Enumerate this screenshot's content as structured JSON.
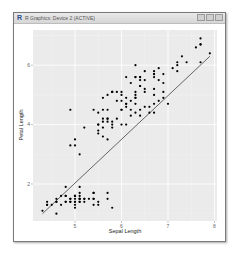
{
  "window": {
    "title": "R Graphics: Device 2 (ACTIVE)",
    "app_icon": "R",
    "controls": [
      "minimize",
      "maximize",
      "close"
    ]
  },
  "chart_data": {
    "type": "scatter",
    "title": "",
    "xlabel": "Sepal Length",
    "ylabel": "Petal Length",
    "xlim": [
      4.2,
      8.0
    ],
    "ylim": [
      0.9,
      7.0
    ],
    "x_ticks": [
      5,
      6,
      7,
      8
    ],
    "y_ticks": [
      2,
      4,
      6
    ],
    "grid": true,
    "background": "#ebebeb",
    "point_color": "#000000",
    "line_color": "#555555",
    "fit_line": {
      "x": [
        4.3,
        7.9
      ],
      "y": [
        1.0,
        6.3
      ]
    },
    "points": [
      [
        5.1,
        1.4
      ],
      [
        4.9,
        1.4
      ],
      [
        4.7,
        1.3
      ],
      [
        4.6,
        1.5
      ],
      [
        5.0,
        1.4
      ],
      [
        5.4,
        1.7
      ],
      [
        4.6,
        1.4
      ],
      [
        5.0,
        1.5
      ],
      [
        4.4,
        1.4
      ],
      [
        4.9,
        1.5
      ],
      [
        5.4,
        1.5
      ],
      [
        4.8,
        1.6
      ],
      [
        4.8,
        1.4
      ],
      [
        4.3,
        1.1
      ],
      [
        5.8,
        1.2
      ],
      [
        5.7,
        1.5
      ],
      [
        5.4,
        1.3
      ],
      [
        5.1,
        1.4
      ],
      [
        5.7,
        1.7
      ],
      [
        5.1,
        1.5
      ],
      [
        5.4,
        1.7
      ],
      [
        5.1,
        1.5
      ],
      [
        4.6,
        1.0
      ],
      [
        5.1,
        1.7
      ],
      [
        4.8,
        1.9
      ],
      [
        5.0,
        1.6
      ],
      [
        5.0,
        1.6
      ],
      [
        5.2,
        1.5
      ],
      [
        5.2,
        1.4
      ],
      [
        4.7,
        1.6
      ],
      [
        4.8,
        1.6
      ],
      [
        5.4,
        1.5
      ],
      [
        5.2,
        1.5
      ],
      [
        5.5,
        1.4
      ],
      [
        4.9,
        1.5
      ],
      [
        5.0,
        1.2
      ],
      [
        5.5,
        1.3
      ],
      [
        4.9,
        1.4
      ],
      [
        4.4,
        1.3
      ],
      [
        5.1,
        1.5
      ],
      [
        5.0,
        1.3
      ],
      [
        4.5,
        1.3
      ],
      [
        4.4,
        1.3
      ],
      [
        5.0,
        1.6
      ],
      [
        5.1,
        1.9
      ],
      [
        4.8,
        1.4
      ],
      [
        5.1,
        1.6
      ],
      [
        4.6,
        1.4
      ],
      [
        5.3,
        1.5
      ],
      [
        5.0,
        1.4
      ],
      [
        7.0,
        4.7
      ],
      [
        6.4,
        4.5
      ],
      [
        6.9,
        4.9
      ],
      [
        5.5,
        4.0
      ],
      [
        6.5,
        4.6
      ],
      [
        5.7,
        4.5
      ],
      [
        6.3,
        4.7
      ],
      [
        4.9,
        3.3
      ],
      [
        6.6,
        4.6
      ],
      [
        5.2,
        3.9
      ],
      [
        5.0,
        3.5
      ],
      [
        5.9,
        4.2
      ],
      [
        6.0,
        4.0
      ],
      [
        6.1,
        4.7
      ],
      [
        5.6,
        3.6
      ],
      [
        6.7,
        4.4
      ],
      [
        5.6,
        4.5
      ],
      [
        5.8,
        4.1
      ],
      [
        6.2,
        4.5
      ],
      [
        5.6,
        3.9
      ],
      [
        5.9,
        4.8
      ],
      [
        6.1,
        4.0
      ],
      [
        6.3,
        4.9
      ],
      [
        6.1,
        4.7
      ],
      [
        6.4,
        4.3
      ],
      [
        6.6,
        4.4
      ],
      [
        6.8,
        4.8
      ],
      [
        6.7,
        5.0
      ],
      [
        6.0,
        4.5
      ],
      [
        5.7,
        3.5
      ],
      [
        5.5,
        3.8
      ],
      [
        5.5,
        3.7
      ],
      [
        5.8,
        3.9
      ],
      [
        6.0,
        5.1
      ],
      [
        5.4,
        4.5
      ],
      [
        6.0,
        4.5
      ],
      [
        6.7,
        4.7
      ],
      [
        6.3,
        4.4
      ],
      [
        5.6,
        4.1
      ],
      [
        5.5,
        4.0
      ],
      [
        5.5,
        4.4
      ],
      [
        6.1,
        4.6
      ],
      [
        5.8,
        4.0
      ],
      [
        5.0,
        3.3
      ],
      [
        5.6,
        4.2
      ],
      [
        5.7,
        4.2
      ],
      [
        5.7,
        4.2
      ],
      [
        6.2,
        4.3
      ],
      [
        5.1,
        3.0
      ],
      [
        5.7,
        4.1
      ],
      [
        6.3,
        6.0
      ],
      [
        5.8,
        5.1
      ],
      [
        7.1,
        5.9
      ],
      [
        6.3,
        5.6
      ],
      [
        6.5,
        5.8
      ],
      [
        7.6,
        6.6
      ],
      [
        4.9,
        4.5
      ],
      [
        7.3,
        6.3
      ],
      [
        6.7,
        5.8
      ],
      [
        7.2,
        6.1
      ],
      [
        6.5,
        5.1
      ],
      [
        6.4,
        5.3
      ],
      [
        6.8,
        5.5
      ],
      [
        5.7,
        5.0
      ],
      [
        5.8,
        5.1
      ],
      [
        6.4,
        5.3
      ],
      [
        6.5,
        5.5
      ],
      [
        7.7,
        6.7
      ],
      [
        7.7,
        6.9
      ],
      [
        6.0,
        5.0
      ],
      [
        6.9,
        5.7
      ],
      [
        5.6,
        4.9
      ],
      [
        7.7,
        6.7
      ],
      [
        6.3,
        4.9
      ],
      [
        6.7,
        5.7
      ],
      [
        7.2,
        6.0
      ],
      [
        6.2,
        4.8
      ],
      [
        6.1,
        4.9
      ],
      [
        6.4,
        5.6
      ],
      [
        7.2,
        5.8
      ],
      [
        7.4,
        6.1
      ],
      [
        7.9,
        6.4
      ],
      [
        6.4,
        5.6
      ],
      [
        6.3,
        5.1
      ],
      [
        6.1,
        5.6
      ],
      [
        7.7,
        6.1
      ],
      [
        6.3,
        5.6
      ],
      [
        6.4,
        5.5
      ],
      [
        6.0,
        4.8
      ],
      [
        6.9,
        5.4
      ],
      [
        6.7,
        5.6
      ],
      [
        6.9,
        5.1
      ],
      [
        5.8,
        5.1
      ],
      [
        6.8,
        5.9
      ],
      [
        6.7,
        5.7
      ],
      [
        6.7,
        5.2
      ],
      [
        6.3,
        5.0
      ],
      [
        6.5,
        5.2
      ],
      [
        6.2,
        5.4
      ],
      [
        5.9,
        5.1
      ]
    ]
  }
}
